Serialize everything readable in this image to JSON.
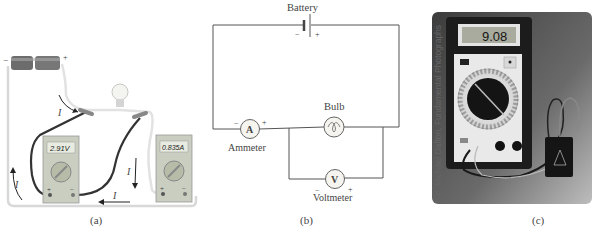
{
  "figure": {
    "panels": [
      {
        "id": "a",
        "caption": "(a)",
        "voltmeter_reading": "2.91V",
        "ammeter_reading": "0.835A",
        "current_label": "I",
        "battery_neg": "−",
        "battery_pos": "+",
        "meter_plus": "+",
        "meter_minus": "−"
      },
      {
        "id": "b",
        "caption": "(b)",
        "battery_label": "Battery",
        "battery_neg": "−",
        "battery_pos": "+",
        "bulb_label": "Bulb",
        "ammeter_symbol": "A",
        "ammeter_label": "Ammeter",
        "ammeter_neg": "−",
        "ammeter_pos": "+",
        "voltmeter_symbol": "V",
        "voltmeter_label": "Voltmeter",
        "voltmeter_neg": "−",
        "voltmeter_pos": "+"
      },
      {
        "id": "c",
        "caption": "(c)",
        "display_reading": "9.08",
        "credit": "c. Michael Dalton, Fundamental Photographs"
      }
    ]
  }
}
